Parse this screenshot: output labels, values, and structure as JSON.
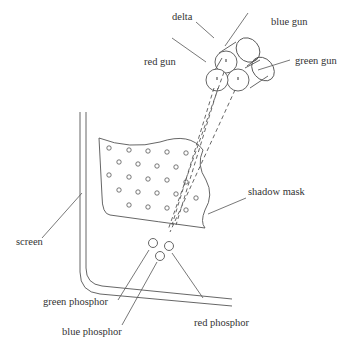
{
  "diagram": {
    "title": "",
    "type": "shadow-mask CRT schematic",
    "stroke_color": "#555555",
    "labels": {
      "delta": "delta",
      "blue_gun": "blue gun",
      "red_gun": "red gun",
      "green_gun": "green gun",
      "shadow_mask": "shadow mask",
      "screen": "screen",
      "green_phosphor": "green phosphor",
      "blue_phosphor": "blue phosphor",
      "red_phosphor": "red phosphor"
    },
    "components": [
      {
        "id": "electron-guns",
        "arrangement": "delta",
        "guns": [
          "red gun",
          "blue gun",
          "green gun"
        ]
      },
      {
        "id": "shadow-mask",
        "holes": 24
      },
      {
        "id": "screen"
      },
      {
        "id": "phosphor-triad",
        "dots": [
          "green phosphor",
          "blue phosphor",
          "red phosphor"
        ]
      }
    ]
  }
}
